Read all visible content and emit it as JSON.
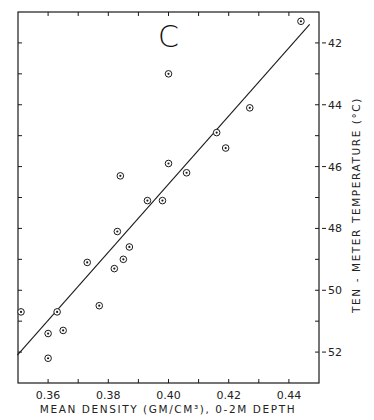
{
  "chart_data": {
    "type": "scatter",
    "title": "C",
    "xlabel": "MEAN DENSITY (GM/CM³), 0-2M DEPTH",
    "ylabel": "TEN - METER TEMPERATURE (°C)",
    "xlim": [
      0.35,
      0.45
    ],
    "ylim": [
      -53,
      -41
    ],
    "x_ticks": [
      0.36,
      0.38,
      0.4,
      0.42,
      0.44
    ],
    "x_tick_labels": [
      "0.36",
      "0.38",
      "0.40",
      "0.42",
      "0.44"
    ],
    "x_minor_ticks": [
      0.37,
      0.39,
      0.41,
      0.43
    ],
    "y_ticks": [
      -42,
      -44,
      -46,
      -48,
      -50,
      -52
    ],
    "y_tick_labels": [
      "-42",
      "-44",
      "-46",
      "-48",
      "-50",
      "-52"
    ],
    "y_minor_ticks": [
      -43,
      -45,
      -47,
      -49,
      -51
    ],
    "y_axis_position": "right",
    "grid": false,
    "legend": null,
    "series": [
      {
        "name": "observations",
        "marker": "circled-dot",
        "points": [
          {
            "x": 0.351,
            "y": -50.7
          },
          {
            "x": 0.363,
            "y": -50.7
          },
          {
            "x": 0.36,
            "y": -51.4
          },
          {
            "x": 0.365,
            "y": -51.3
          },
          {
            "x": 0.36,
            "y": -52.2
          },
          {
            "x": 0.373,
            "y": -49.1
          },
          {
            "x": 0.377,
            "y": -50.5
          },
          {
            "x": 0.382,
            "y": -49.3
          },
          {
            "x": 0.385,
            "y": -49.0
          },
          {
            "x": 0.387,
            "y": -48.6
          },
          {
            "x": 0.383,
            "y": -48.1
          },
          {
            "x": 0.384,
            "y": -46.3
          },
          {
            "x": 0.393,
            "y": -47.1
          },
          {
            "x": 0.398,
            "y": -47.1
          },
          {
            "x": 0.4,
            "y": -45.9
          },
          {
            "x": 0.406,
            "y": -46.2
          },
          {
            "x": 0.4,
            "y": -43.0
          },
          {
            "x": 0.416,
            "y": -44.9
          },
          {
            "x": 0.419,
            "y": -45.4
          },
          {
            "x": 0.427,
            "y": -44.1
          },
          {
            "x": 0.444,
            "y": -41.3
          }
        ]
      },
      {
        "name": "regression line",
        "type": "line",
        "points": [
          {
            "x": 0.3498,
            "y": -52.1
          },
          {
            "x": 0.4469,
            "y": -41.4
          }
        ]
      }
    ]
  },
  "labels": {
    "panel": "C",
    "xlabel": "MEAN DENSITY (GM/CM³), 0-2M DEPTH",
    "ylabel": "TEN - METER TEMPERATURE (°C)"
  },
  "colors": {
    "ink": "#1a1a1a",
    "background": "#ffffff"
  }
}
